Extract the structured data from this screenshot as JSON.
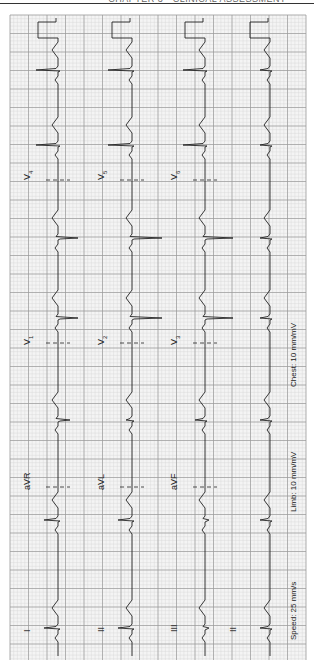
{
  "page": {
    "running_head": "CHAPTER 3  ·  CLINICAL ASSESSMENT"
  },
  "ecg": {
    "orientation": "rotated 90° counter-clockwise",
    "grid": {
      "x0": 10,
      "y0": 15,
      "x1": 306,
      "y1": 660,
      "minor": 3.7,
      "major": 18.5
    },
    "colors": {
      "grid_minor": "#d4d4d4",
      "grid_major": "#9a9a9a",
      "trace": "#222222",
      "paper": "#f4f4f4"
    },
    "settings": {
      "speed": "Speed: 25 mm/s",
      "limb": "Limb: 10 mm/mV",
      "chest": "Chest: 10 mm/mV"
    },
    "rows": [
      {
        "baseline": 58,
        "leads": [
          {
            "name": "I",
            "label": "I",
            "label_y": 632
          },
          {
            "name": "aVR",
            "label": "aVR",
            "label_y": 490
          },
          {
            "name": "V1",
            "label": "V",
            "sub": "1",
            "label_y": 345
          },
          {
            "name": "V4",
            "label": "V",
            "sub": "4",
            "label_y": 180
          }
        ]
      },
      {
        "baseline": 132,
        "leads": [
          {
            "name": "II",
            "label": "II",
            "label_y": 632
          },
          {
            "name": "aVL",
            "label": "aVL",
            "label_y": 490
          },
          {
            "name": "V2",
            "label": "V",
            "sub": "2",
            "label_y": 345
          },
          {
            "name": "V5",
            "label": "V",
            "sub": "5",
            "label_y": 180
          }
        ]
      },
      {
        "baseline": 205,
        "leads": [
          {
            "name": "III",
            "label": "III",
            "label_y": 632
          },
          {
            "name": "aVF",
            "label": "aVF",
            "label_y": 490
          },
          {
            "name": "V3",
            "label": "V",
            "sub": "3",
            "label_y": 345
          },
          {
            "name": "V6",
            "label": "V",
            "sub": "6",
            "label_y": 180
          }
        ]
      },
      {
        "baseline": 270,
        "leads": [
          {
            "name": "II-rhythm",
            "label": "II",
            "label_y": 632
          }
        ]
      }
    ],
    "beats_y": [
      628,
      520,
      420,
      318,
      238,
      145,
      70
    ],
    "lead_change_y": [
      487,
      343,
      180
    ]
  }
}
